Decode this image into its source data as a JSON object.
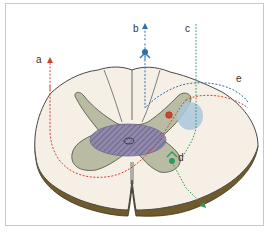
{
  "figure": {
    "labels": {
      "a": "a",
      "b": "b",
      "c": "c",
      "d": "d",
      "e": "e"
    },
    "colors": {
      "frame": "#c9c9c9",
      "white_matter": "#f6efe6",
      "cord_outline": "#4a4a4a",
      "pia_rim": "#6e5a2c",
      "gray_matter": "#b9bba3",
      "gray_matter_outline": "#5a5a4e",
      "central_zone": "#8c84ad",
      "central_zone_hatch": "#5a4f7a",
      "red_path": "#d2432f",
      "blue_path": "#2f6eaa",
      "green_path": "#2e9a5a",
      "blue_spot": "#a9c7db"
    },
    "pathways": [
      {
        "id": "a",
        "color": "red",
        "direction": "ascending",
        "marker": "arrow-up"
      },
      {
        "id": "b",
        "color": "blue",
        "direction": "ascending",
        "marker": "arrow-up with dot"
      },
      {
        "id": "c",
        "color": "green",
        "direction": "vertical dotted"
      },
      {
        "id": "d",
        "color": "green",
        "direction": "exiting ventral",
        "marker": "dot with arrow"
      },
      {
        "id": "e",
        "color": "blue/red",
        "direction": "lateral curved"
      }
    ]
  }
}
